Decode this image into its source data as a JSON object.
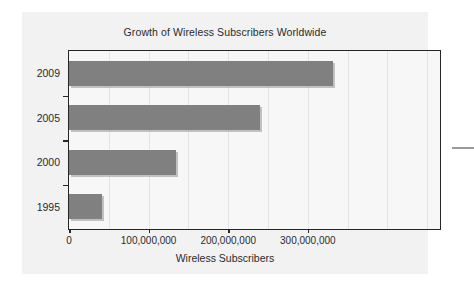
{
  "figure": {
    "title": "Growth of Wireless Subscribers Worldwide",
    "background_color": "#f2f2f2",
    "plot_background_color": "#f7f7f7",
    "frame_color": "#262626",
    "bar_color": "#808080",
    "gridline_color": "#e4e4e4"
  },
  "chart_data": {
    "type": "bar",
    "orientation": "horizontal",
    "title": "Growth of Wireless Subscribers Worldwide",
    "subtitle": "",
    "xlabel": "Wireless Subscribers",
    "ylabel": "",
    "categories": [
      "1995",
      "2000",
      "2005",
      "2009"
    ],
    "values": [
      41000000,
      134000000,
      240000000,
      331000000
    ],
    "series": [
      {
        "name": "Wireless Subscribers",
        "values": [
          41000000,
          134000000,
          240000000,
          331000000
        ]
      }
    ],
    "xlim": [
      0,
      466000000
    ],
    "xticks": [
      0,
      100000000,
      200000000,
      300000000
    ],
    "xticklabels": [
      "0",
      "100,000,000",
      "200,000,000",
      "300,000,000"
    ],
    "yticklabels_top_to_bottom": [
      "2009",
      "2005",
      "2000",
      "1995"
    ],
    "grid": "vertical-only",
    "legend": "none",
    "legend_position": "none"
  },
  "axes": {
    "x_title": "Wireless Subscribers",
    "x_tick_labels": [
      "0",
      "100,000,000",
      "200,000,000",
      "300,000,000"
    ],
    "y_tick_labels": [
      "2009",
      "2005",
      "2000",
      "1995"
    ]
  }
}
